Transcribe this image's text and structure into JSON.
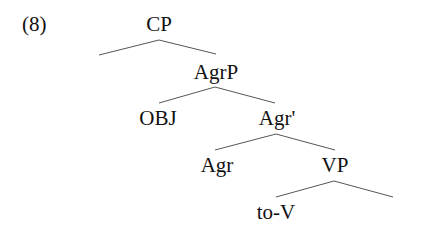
{
  "example_number": "(8)",
  "tree": {
    "nodes": {
      "cp": "CP",
      "agrp": "AgrP",
      "obj": "OBJ",
      "agr_bar": "Agr'",
      "agr": "Agr",
      "vp": "VP",
      "to_v": "to-V",
      "vp_right": ""
    },
    "edges": [
      [
        "CP",
        "(empty left)"
      ],
      [
        "CP",
        "AgrP"
      ],
      [
        "AgrP",
        "OBJ"
      ],
      [
        "AgrP",
        "Agr'"
      ],
      [
        "Agr'",
        "Agr"
      ],
      [
        "Agr'",
        "VP"
      ],
      [
        "VP",
        "to-V"
      ],
      [
        "VP",
        "(empty right)"
      ]
    ]
  },
  "colors": {
    "text": "#111111",
    "edge": "#555555",
    "background": "#ffffff"
  }
}
